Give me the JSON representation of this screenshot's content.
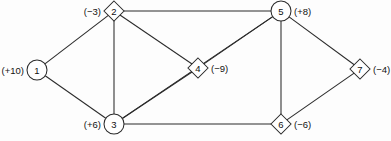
{
  "figure": {
    "background_color": "#fdfdfd",
    "line_color": "#2b2b2b",
    "node_fill_color": "#ffffff",
    "text_color": "#111111"
  },
  "nodes": [
    {
      "id": "1",
      "supply": "(+10)",
      "shape": "circle",
      "x": 37,
      "y": 70,
      "r": 10,
      "label_side": "left"
    },
    {
      "id": "2",
      "supply": "(−3)",
      "shape": "diamond",
      "x": 114,
      "y": 11,
      "r": 10,
      "label_side": "left"
    },
    {
      "id": "3",
      "supply": "(+6)",
      "shape": "circle",
      "x": 114,
      "y": 124,
      "r": 10,
      "label_side": "left"
    },
    {
      "id": "4",
      "supply": "(−9)",
      "shape": "diamond",
      "x": 198,
      "y": 68,
      "r": 10,
      "label_side": "right"
    },
    {
      "id": "5",
      "supply": "(+8)",
      "shape": "circle",
      "x": 281,
      "y": 11,
      "r": 10,
      "label_side": "right"
    },
    {
      "id": "6",
      "supply": "(−6)",
      "shape": "diamond",
      "x": 281,
      "y": 124,
      "r": 10,
      "label_side": "right"
    },
    {
      "id": "7",
      "supply": "(−4)",
      "shape": "diamond",
      "x": 360,
      "y": 69,
      "r": 10,
      "label_side": "right"
    }
  ],
  "edges": [
    {
      "from": "1",
      "to": "2"
    },
    {
      "from": "1",
      "to": "3"
    },
    {
      "from": "2",
      "to": "3"
    },
    {
      "from": "2",
      "to": "4"
    },
    {
      "from": "2",
      "to": "5"
    },
    {
      "from": "3",
      "to": "4"
    },
    {
      "from": "3",
      "to": "5"
    },
    {
      "from": "3",
      "to": "6"
    },
    {
      "from": "4",
      "to": "5"
    },
    {
      "from": "5",
      "to": "6"
    },
    {
      "from": "5",
      "to": "7"
    },
    {
      "from": "6",
      "to": "7"
    }
  ]
}
